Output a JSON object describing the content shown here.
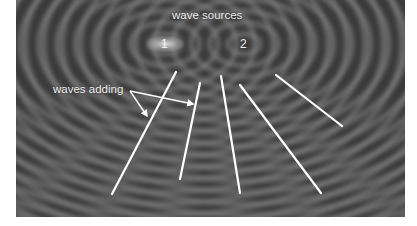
{
  "diagram": {
    "labels": {
      "sources": "wave sources",
      "source_1": "1",
      "source_2": "2",
      "adding": "waves adding"
    },
    "sources": [
      {
        "id": "1",
        "x": 165,
        "y": 44
      },
      {
        "id": "2",
        "x": 244,
        "y": 44
      }
    ],
    "constructive_lines": [
      {
        "x1": 176,
        "y1": 72,
        "x2": 112,
        "y2": 194
      },
      {
        "x1": 200,
        "y1": 83,
        "x2": 180,
        "y2": 179
      },
      {
        "x1": 221,
        "y1": 76,
        "x2": 240,
        "y2": 193
      },
      {
        "x1": 240,
        "y1": 85,
        "x2": 321,
        "y2": 193
      },
      {
        "x1": 276,
        "y1": 75,
        "x2": 342,
        "y2": 126
      }
    ],
    "arrows": [
      {
        "x1": 130,
        "y1": 91,
        "x2": 147,
        "y2": 116
      },
      {
        "x1": 130,
        "y1": 91,
        "x2": 193,
        "y2": 104
      }
    ],
    "colors": {
      "background": "#3c3c3c",
      "ripple_light": "#8a8a8a",
      "lines": "#ffffff",
      "text": "#f2f2f2",
      "page": "#ffffff"
    }
  }
}
